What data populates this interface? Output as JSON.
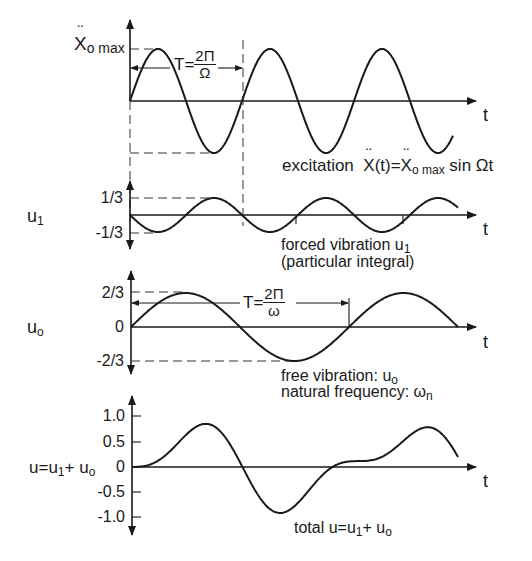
{
  "figure": {
    "panels": [
      {
        "id": "excitation",
        "y_label": "Ẍo max",
        "y_label_main": "X",
        "y_label_sub": "o max",
        "period_label": {
          "prefix": "T=",
          "num": "2Π",
          "den": "Ω"
        },
        "t_label": "t",
        "caption": {
          "text": "excitation",
          "formula_lhs": "X",
          "formula_mid": "(t)=",
          "formula_x": "X",
          "formula_sub": "o max",
          "formula_rhs": " sin Ωt"
        }
      },
      {
        "id": "forced",
        "y_label": "u1",
        "y_label_main": "u",
        "y_label_sub": "1",
        "ticks": [
          "1/3",
          "-1/3"
        ],
        "t_label": "t",
        "caption": {
          "line1_text": "forced vibration ",
          "line1_var": "u",
          "line1_sub": "1",
          "line2": "(particular integral)"
        }
      },
      {
        "id": "free",
        "y_label": "uo",
        "y_label_main": "u",
        "y_label_sub": "o",
        "ticks": [
          "2/3",
          "0",
          "-2/3"
        ],
        "period_label": {
          "prefix": "T=",
          "num": "2Π",
          "den": "ω"
        },
        "t_label": "t",
        "caption": {
          "line1_text": "free vibration: ",
          "line1_var": "u",
          "line1_sub": "o",
          "line2_text": "natural frequency: ",
          "line2_var": "ω",
          "line2_sub": "n"
        }
      },
      {
        "id": "total",
        "y_label": "u=u1+ uo",
        "y_label_a": "u=u",
        "y_label_a_sub": "1",
        "y_label_b": "+ u",
        "y_label_b_sub": "o",
        "ticks": [
          "1.0",
          "0.5",
          "0",
          "-0.5",
          "-1.0"
        ],
        "t_label": "t",
        "caption": {
          "text_a": "total u=u",
          "sub_a": "1",
          "text_b": "+ u",
          "sub_b": "o"
        }
      }
    ]
  },
  "chart_data": [
    {
      "type": "line",
      "title": "excitation Ẍ(t)=Ẍo max sin Ωt",
      "xlabel": "t",
      "ylabel": "Ẍo max",
      "series": [
        {
          "name": "excitation",
          "function": "sin(Ωt)",
          "amplitude": 1.0,
          "periods_shown": 2.9
        }
      ],
      "annotations": [
        "T=2Π/Ω"
      ]
    },
    {
      "type": "line",
      "title": "forced vibration u1 (particular integral)",
      "xlabel": "t",
      "ylabel": "u1",
      "yticks": [
        "1/3",
        "-1/3"
      ],
      "series": [
        {
          "name": "u1",
          "function": "-(1/3) sin(Ωt)",
          "amplitude": 0.333,
          "periods_shown": 2.9
        }
      ]
    },
    {
      "type": "line",
      "title": "free vibration: uo, natural frequency: ωn",
      "xlabel": "t",
      "ylabel": "uo",
      "yticks": [
        "2/3",
        "0",
        "-2/3"
      ],
      "series": [
        {
          "name": "uo",
          "function": "(2/3) sin(ωt)",
          "amplitude": 0.667,
          "periods_shown": 1.5
        }
      ],
      "annotations": [
        "T=2Π/ω"
      ]
    },
    {
      "type": "line",
      "title": "total u=u1+ uo",
      "xlabel": "t",
      "ylabel": "u=u1+ uo",
      "yticks": [
        1.0,
        0.5,
        0,
        -0.5,
        -1.0
      ],
      "ylim": [
        -1.0,
        1.0
      ],
      "series": [
        {
          "name": "u",
          "function": "u1 + uo",
          "peaks": [
            0.86,
            -0.83,
            0.87
          ]
        }
      ]
    }
  ]
}
